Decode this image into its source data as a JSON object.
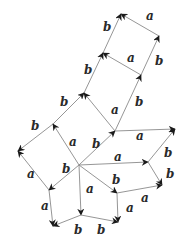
{
  "diagram": {
    "type": "cayley-graph",
    "colors": {
      "edge": "#8a8a8a",
      "arrow": "#1a1a1a",
      "label": "#2a2a2a",
      "background": "#ffffff"
    },
    "nodes": {
      "n_top": [
        121,
        14
      ],
      "n_tr": [
        159,
        36
      ],
      "n_mid": [
        103,
        53
      ],
      "n_mr": [
        141,
        75
      ],
      "n_up": [
        84,
        93
      ],
      "n_ul": [
        53,
        124
      ],
      "n_left": [
        18,
        151
      ],
      "n_c2": [
        115,
        131
      ],
      "n_right": [
        175,
        129
      ],
      "n_center": [
        79,
        165
      ],
      "n_rm": [
        148,
        162
      ],
      "n_rb": [
        162,
        185
      ],
      "n_l2": [
        49,
        190
      ],
      "n_bl": [
        53,
        226
      ],
      "n_bm": [
        81,
        215
      ],
      "n_br": [
        118,
        222
      ],
      "n_bb": [
        117,
        193
      ]
    },
    "edges": [
      {
        "from": "n_tr",
        "to": "n_top",
        "label": "a",
        "lx": 146,
        "ly": 20
      },
      {
        "from": "n_mid",
        "to": "n_top",
        "label": "b",
        "lx": 103,
        "ly": 31
      },
      {
        "from": "n_mr",
        "to": "n_tr",
        "label": "b",
        "lx": 155,
        "ly": 65
      },
      {
        "from": "n_mr",
        "to": "n_mid",
        "label": "a",
        "lx": 127,
        "ly": 62
      },
      {
        "from": "n_up",
        "to": "n_mid",
        "label": "b",
        "lx": 84,
        "ly": 74
      },
      {
        "from": "n_c2",
        "to": "n_mr",
        "label": "b",
        "lx": 135,
        "ly": 106
      },
      {
        "from": "n_c2",
        "to": "n_up",
        "label": "a",
        "lx": 111,
        "ly": 114
      },
      {
        "from": "n_ul",
        "to": "n_up",
        "label": "b",
        "lx": 60,
        "ly": 106
      },
      {
        "from": "n_ul",
        "to": "n_left",
        "label": "b",
        "lx": 31,
        "ly": 130
      },
      {
        "from": "n_center",
        "to": "n_ul",
        "label": "a",
        "lx": 69,
        "ly": 146
      },
      {
        "from": "n_center",
        "to": "n_c2",
        "label": "b",
        "lx": 92,
        "ly": 148
      },
      {
        "from": "n_c2",
        "to": "n_right",
        "label": "a",
        "lx": 136,
        "ly": 140
      },
      {
        "from": "n_center",
        "to": "n_rm",
        "label": "a",
        "lx": 114,
        "ly": 161
      },
      {
        "from": "n_rm",
        "to": "n_right",
        "label": "b",
        "lx": 164,
        "ly": 157
      },
      {
        "from": "n_rm",
        "to": "n_rb",
        "label": "b",
        "lx": 166,
        "ly": 178
      },
      {
        "from": "n_l2",
        "to": "n_left",
        "label": "a",
        "lx": 27,
        "ly": 178
      },
      {
        "from": "n_center",
        "to": "n_l2",
        "label": "b",
        "lx": 62,
        "ly": 173
      },
      {
        "from": "n_l2",
        "to": "n_bl",
        "label": "a",
        "lx": 41,
        "ly": 210
      },
      {
        "from": "n_center",
        "to": "n_bm",
        "label": "a",
        "lx": 86,
        "ly": 193
      },
      {
        "from": "n_bm",
        "to": "n_bl",
        "label": "b",
        "lx": 74,
        "ly": 234
      },
      {
        "from": "n_bm",
        "to": "n_br",
        "label": "b",
        "lx": 97,
        "ly": 234
      },
      {
        "from": "n_center",
        "to": "n_bb",
        "label": "b",
        "lx": 112,
        "ly": 184
      },
      {
        "from": "n_bb",
        "to": "n_br",
        "label": "a",
        "lx": 126,
        "ly": 212
      },
      {
        "from": "n_bb",
        "to": "n_rb",
        "label": "a",
        "lx": 141,
        "ly": 202
      }
    ]
  }
}
